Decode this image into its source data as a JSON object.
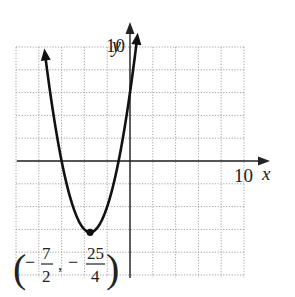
{
  "chart_data": {
    "type": "line",
    "title": "",
    "function": "y = x^2 + 7x + 6",
    "xlabel": "x",
    "ylabel": "y",
    "x_tick_label": "10",
    "y_tick_label": "10",
    "xlim": [
      -10,
      10
    ],
    "ylim": [
      -10,
      10
    ],
    "grid": true,
    "grid_step": 2,
    "series": [
      {
        "name": "parabola",
        "x": [
          -7.5,
          -7,
          -6,
          -5,
          -4,
          -3.5,
          -3,
          -2,
          -1,
          0,
          0.7
        ],
        "y": [
          9.75,
          6,
          0,
          -4,
          -6,
          -6.25,
          -6,
          -4,
          0,
          6,
          11.39
        ]
      }
    ],
    "annotations": [
      {
        "text": "(-7/2, -25/4)",
        "x": -3.5,
        "y": -6.25,
        "type": "vertex"
      }
    ]
  },
  "labels": {
    "y_axis": "y",
    "x_axis": "x",
    "y_ten": "10",
    "x_ten": "10",
    "vertex_x_num": "7",
    "vertex_x_den": "2",
    "vertex_y_num": "25",
    "vertex_y_den": "4",
    "minus": "−",
    "lparen": "(",
    "rparen": ")",
    "comma": ","
  }
}
